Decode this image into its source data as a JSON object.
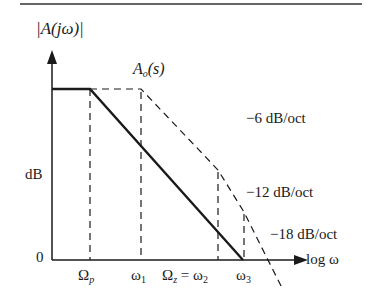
{
  "figure": {
    "y_axis_label": "|A(jω)|",
    "y_axis_unit": "dB",
    "y_zero": "0",
    "x_axis_label": "log ω",
    "curve_label": "A",
    "curve_label_sub": "o",
    "curve_label_arg": "(s)",
    "slopes": [
      {
        "label": "−6 dB/oct"
      },
      {
        "label": "−12 dB/oct"
      },
      {
        "label": "−18 dB/oct"
      }
    ],
    "x_ticks": {
      "omega_p": "Ω",
      "omega_p_sub": "p",
      "omega_1": "ω",
      "omega_1_sub": "1",
      "omega_z": "Ω",
      "omega_z_sub": "z",
      "eq": "=",
      "omega_2": "ω",
      "omega_2_sub": "2",
      "omega_3": "ω",
      "omega_3_sub": "3"
    },
    "colors": {
      "ink": "#1a1a1a",
      "background": "#ffffff"
    }
  }
}
